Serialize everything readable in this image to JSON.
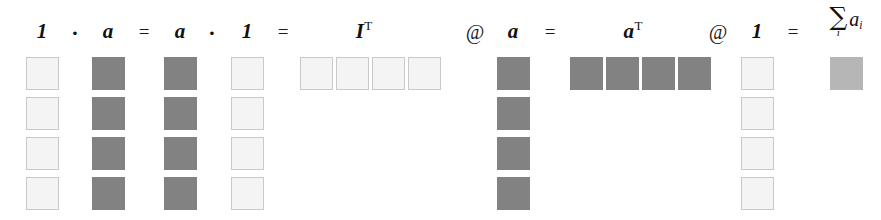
{
  "figure": {
    "type": "matrix-operation-diagram",
    "background": "#ffffff",
    "colors": {
      "light_fill": "#f4f4f4",
      "light_border": "#c9c9c9",
      "dark_fill": "#828282",
      "result_fill": "#b6b6b6",
      "text": "#111111"
    },
    "labels": [
      {
        "id": "l1",
        "text": "1",
        "sup": "",
        "kind": "vector",
        "x": 42,
        "y": 21
      },
      {
        "id": "op1",
        "text": "·",
        "sup": "",
        "kind": "dot",
        "x": 75,
        "y": 22
      },
      {
        "id": "l2",
        "text": "a",
        "sup": "",
        "kind": "vector",
        "x": 108,
        "y": 21
      },
      {
        "id": "op2",
        "text": "=",
        "sup": "",
        "kind": "operator",
        "x": 144,
        "y": 22
      },
      {
        "id": "l3",
        "text": "a",
        "sup": "",
        "kind": "vector",
        "x": 180,
        "y": 21
      },
      {
        "id": "op3",
        "text": "·",
        "sup": "",
        "kind": "dot",
        "x": 212,
        "y": 22
      },
      {
        "id": "l4",
        "text": "1",
        "sup": "",
        "kind": "vector",
        "x": 247,
        "y": 21
      },
      {
        "id": "op4",
        "text": "=",
        "sup": "",
        "kind": "operator",
        "x": 283,
        "y": 22
      },
      {
        "id": "l5",
        "text": "I",
        "sup": "T",
        "kind": "vector",
        "x": 364,
        "y": 21
      },
      {
        "id": "at1",
        "text": "@",
        "sup": "",
        "kind": "at",
        "x": 475,
        "y": 22
      },
      {
        "id": "l6",
        "text": "a",
        "sup": "",
        "kind": "vector",
        "x": 513,
        "y": 21
      },
      {
        "id": "op5",
        "text": "=",
        "sup": "",
        "kind": "operator",
        "x": 550,
        "y": 22
      },
      {
        "id": "l7",
        "text": "a",
        "sup": "T",
        "kind": "vector",
        "x": 633,
        "y": 21
      },
      {
        "id": "at2",
        "text": "@",
        "sup": "",
        "kind": "at",
        "x": 718,
        "y": 22
      },
      {
        "id": "l8",
        "text": "1",
        "sup": "",
        "kind": "vector",
        "x": 757,
        "y": 21
      },
      {
        "id": "op6",
        "text": "=",
        "sup": "",
        "kind": "operator",
        "x": 793,
        "y": 22
      }
    ],
    "sum_label": {
      "id": "sum1",
      "sigma": "∑",
      "sigma_subscript": "i",
      "term": "a",
      "term_subscript": "i",
      "x": 846,
      "y": 6
    },
    "blocks": [
      {
        "id": "col-1-a",
        "name": "vector-1-left",
        "tone": "light",
        "orientation": "column",
        "x": 26,
        "y": 57,
        "w": 33,
        "h": 33,
        "count": 4,
        "step": 40
      },
      {
        "id": "col-a-b",
        "name": "vector-a-left",
        "tone": "dark",
        "orientation": "column",
        "x": 92,
        "y": 57,
        "w": 33,
        "h": 33,
        "count": 4,
        "step": 40
      },
      {
        "id": "col-a-c",
        "name": "vector-a-right",
        "tone": "dark",
        "orientation": "column",
        "x": 164,
        "y": 57,
        "w": 33,
        "h": 33,
        "count": 4,
        "step": 40
      },
      {
        "id": "col-1-d",
        "name": "vector-1-right",
        "tone": "light",
        "orientation": "column",
        "x": 231,
        "y": 57,
        "w": 33,
        "h": 33,
        "count": 4,
        "step": 40
      },
      {
        "id": "row-It",
        "name": "vector-I-transpose",
        "tone": "light",
        "orientation": "row",
        "x": 300,
        "y": 57,
        "w": 33,
        "h": 33,
        "count": 4,
        "step": 36
      },
      {
        "id": "col-a-e",
        "name": "vector-a-at",
        "tone": "dark",
        "orientation": "column",
        "x": 497,
        "y": 57,
        "w": 33,
        "h": 33,
        "count": 4,
        "step": 40
      },
      {
        "id": "row-at",
        "name": "vector-a-transpose",
        "tone": "dark",
        "orientation": "row",
        "x": 570,
        "y": 57,
        "w": 33,
        "h": 33,
        "count": 4,
        "step": 36
      },
      {
        "id": "col-1-f",
        "name": "vector-1-at",
        "tone": "light",
        "orientation": "column",
        "x": 741,
        "y": 57,
        "w": 33,
        "h": 33,
        "count": 4,
        "step": 40
      },
      {
        "id": "res-sum",
        "name": "scalar-sum-result",
        "tone": "mid",
        "orientation": "single",
        "x": 830,
        "y": 57,
        "w": 33,
        "h": 33,
        "count": 1,
        "step": 0
      }
    ]
  }
}
